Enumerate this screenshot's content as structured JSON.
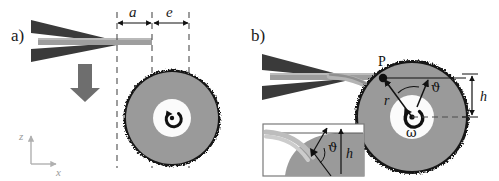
{
  "figure": {
    "background_color": "#ffffff",
    "width": 499,
    "height": 181
  },
  "panels": [
    {
      "id": "a",
      "label": "a)",
      "description": "Cantilever approaching rotating disk from above"
    },
    {
      "id": "b",
      "label": "b)",
      "description": "Bent cantilever in contact with rotating disk at point P"
    }
  ],
  "panel_a": {
    "label": "a)",
    "dimension_a": "a",
    "dimension_e": "e",
    "axes": {
      "z_label": "z",
      "x_label": "x"
    },
    "disk": {
      "rotation_symbol": "rotation-arrow"
    },
    "approach_arrow": "down-arrow"
  },
  "panel_b": {
    "label": "b)",
    "contact_point": "P",
    "radius_label": "r",
    "angle_label": "ϑ",
    "height_label": "h",
    "omega_label": "ω"
  },
  "inset": {
    "angle_label": "ϑ",
    "height_label": "h"
  },
  "colors": {
    "dark_wedge": "#3a3a3a",
    "cantilever_gray": "#9e9e9e",
    "disk_body": "#9a9a9a",
    "disk_rim": "#141414",
    "disk_hub": "#fbfbfb",
    "dashed_line": "#4d4d4d",
    "axis_gray": "#b0b0b0",
    "arrow_gray": "#6e6e6e",
    "text_black": "#111111",
    "inset_border": "#7a7a7a"
  }
}
